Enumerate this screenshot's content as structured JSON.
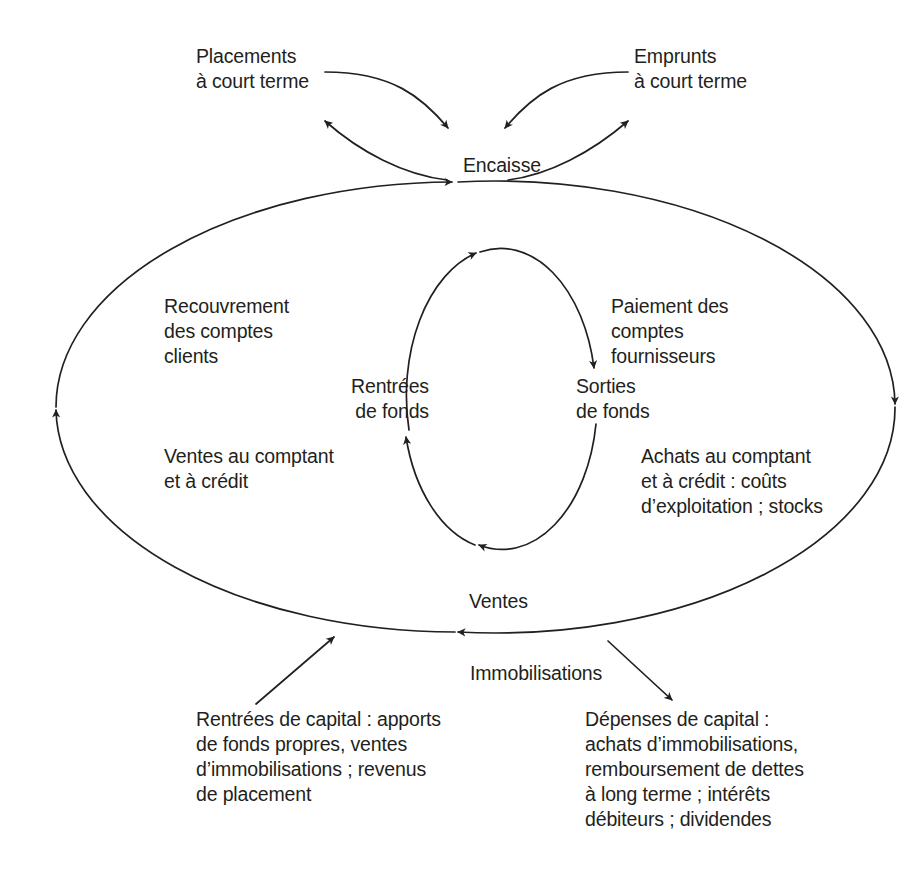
{
  "diagram": {
    "stroke_color": "#231f20",
    "text_color": "#231f20",
    "background_color": "#ffffff",
    "nodes": {
      "placements_court_terme": "Placements\nà court terme",
      "emprunts_court_terme": "Emprunts\nà court terme",
      "encaisse": "Encaisse",
      "recouvrement_comptes_clients": "Recouvrement\ndes comptes\nclients",
      "paiement_comptes_fournisseurs": "Paiement des\ncomptes\nfournisseurs",
      "rentrees_de_fonds": "Rentrées\nde fonds",
      "sorties_de_fonds": "Sorties\nde fonds",
      "ventes_au_comptant": "Ventes au comptant\net à crédit",
      "achats_au_comptant": "Achats au comptant\net à crédit : coûts\nd’exploitation ; stocks",
      "ventes": "Ventes",
      "immobilisations": "Immobilisations",
      "rentrees_de_capital": "Rentrées de capital : apports\nde fonds propres, ventes\nd’immobilisations ; revenus\nde placement",
      "depenses_de_capital": "Dépenses de capital :\nachats d’immobilisations,\nremboursement de dettes\nà long terme ; intérêts\ndébiteurs ; dividendes"
    },
    "flows": [
      {
        "id": "placements-to-encaisse",
        "from": "placements_court_terme",
        "to": "encaisse",
        "direction": "down-right"
      },
      {
        "id": "encaisse-to-placements",
        "from": "encaisse",
        "to": "placements_court_terme",
        "direction": "up-left"
      },
      {
        "id": "emprunts-to-encaisse",
        "from": "emprunts_court_terme",
        "to": "encaisse",
        "direction": "down-left"
      },
      {
        "id": "encaisse-to-emprunts",
        "from": "encaisse",
        "to": "emprunts_court_terme",
        "direction": "up-right"
      },
      {
        "id": "outer-left-up",
        "from": "ventes",
        "to": "encaisse",
        "direction": "up"
      },
      {
        "id": "outer-right-down",
        "from": "encaisse",
        "to": "ventes",
        "direction": "down"
      },
      {
        "id": "inner-top-right",
        "from": "rentrees_de_fonds",
        "to": "sorties_de_fonds",
        "direction": "right"
      },
      {
        "id": "inner-bottom-left",
        "from": "sorties_de_fonds",
        "to": "rentrees_de_fonds",
        "direction": "left"
      },
      {
        "id": "capital-in",
        "from": "rentrees_de_capital",
        "to": "ventes",
        "direction": "up-right"
      },
      {
        "id": "capital-out",
        "from": "ventes",
        "to": "depenses_de_capital",
        "direction": "down-right"
      }
    ]
  }
}
